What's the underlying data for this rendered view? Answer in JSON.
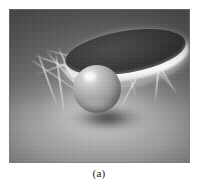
{
  "figure": {
    "caption": "(a)",
    "alt_description": "Grayscale rendering of a dark elliptical disk suspended above a glossy sphere resting on a floor, with crossing light rays and a soft radial glow",
    "frame": {
      "x": 9,
      "y": 9,
      "width": 181,
      "height": 154
    },
    "colors": {
      "page_background": "#ffffff",
      "scene_background_top": "#616161",
      "scene_background_bottom": "#9a9a9a",
      "disk_face": "#333333",
      "disk_rim_highlight": "#ffffff",
      "sphere_midtone": "#a8a8a8",
      "sphere_highlight": "#ffffff",
      "contact_shadow": "#161616",
      "ray_color": "#ffffff",
      "caption_color": "#1a1a1a"
    },
    "objects": [
      {
        "name": "elliptical-disk",
        "shape": "ellipse",
        "cx": 117,
        "cy": 46,
        "rx": 61,
        "ry": 21,
        "rotation_deg": -9.5,
        "fill": "#333333"
      },
      {
        "name": "sphere",
        "shape": "circle",
        "cx": 88,
        "cy": 80,
        "r": 24,
        "fill": "#a8a8a8"
      },
      {
        "name": "contact-shadow",
        "shape": "ellipse",
        "cx": 98,
        "cy": 110,
        "rx": 40,
        "ry": 14,
        "fill": "#161616"
      },
      {
        "name": "floor-glow",
        "shape": "radial-glow",
        "cx": 96,
        "cy": 113,
        "rx": 101,
        "ry": 55,
        "fill": "#ffffff"
      }
    ],
    "rays": [
      {
        "x": 30,
        "y": 58,
        "length": 78,
        "angle": 34
      },
      {
        "x": 34,
        "y": 54,
        "length": 96,
        "angle": 20
      },
      {
        "x": 46,
        "y": 50,
        "length": 84,
        "angle": 48
      },
      {
        "x": 58,
        "y": 46,
        "length": 72,
        "angle": 64
      },
      {
        "x": 128,
        "y": 44,
        "length": 86,
        "angle": 138
      },
      {
        "x": 140,
        "y": 48,
        "length": 74,
        "angle": 152
      },
      {
        "x": 150,
        "y": 52,
        "length": 66,
        "angle": 118
      },
      {
        "x": 124,
        "y": 42,
        "length": 96,
        "angle": 160
      },
      {
        "x": 42,
        "y": 48,
        "length": 112,
        "angle": 14
      },
      {
        "x": 136,
        "y": 46,
        "length": 58,
        "angle": 48
      },
      {
        "x": 150,
        "y": 50,
        "length": 52,
        "angle": 58
      },
      {
        "x": 56,
        "y": 52,
        "length": 62,
        "angle": 82
      },
      {
        "x": 108,
        "y": 44,
        "length": 70,
        "angle": 104
      },
      {
        "x": 120,
        "y": 40,
        "length": 64,
        "angle": 74
      },
      {
        "x": 38,
        "y": 52,
        "length": 58,
        "angle": 70
      },
      {
        "x": 160,
        "y": 56,
        "length": 46,
        "angle": 96
      }
    ]
  }
}
